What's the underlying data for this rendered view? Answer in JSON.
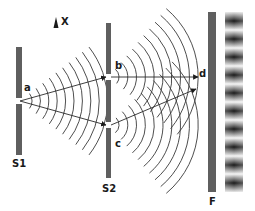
{
  "axis": {
    "label": "X",
    "icon": "up-arrow-icon"
  },
  "barriers": [
    {
      "id": "S1",
      "label": "S1"
    },
    {
      "id": "S2",
      "label": "S2"
    },
    {
      "id": "F",
      "label": "F"
    }
  ],
  "points": {
    "a": "a",
    "b": "b",
    "c": "c",
    "d": "d"
  },
  "colors": {
    "barrier": "#5f5f5f",
    "lines": "#2a2a2a",
    "background": "#ffffff"
  },
  "fringes": {
    "count_dark": 10,
    "count_bright": 10
  }
}
